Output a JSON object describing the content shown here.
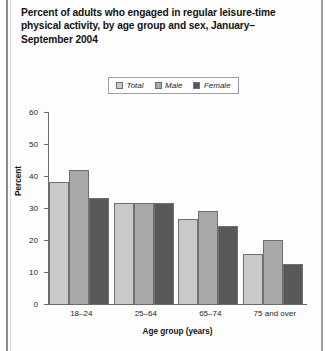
{
  "title": "Percent of adults who engaged in regular leisure-time physical activity, by age group and sex, January–September 2004",
  "colors": {
    "total": "#c9c9c9",
    "male": "#a8a8a8",
    "female": "#585858",
    "axis": "#6a6a6a",
    "text": "#1d1d1d"
  },
  "chart_data": {
    "type": "bar",
    "title": "Percent of adults who engaged in regular leisure-time physical activity, by age group and sex, January–September 2004",
    "xlabel": "Age group (years)",
    "ylabel": "Percent",
    "categories": [
      "18–24",
      "25–64",
      "65–74",
      "75 and over"
    ],
    "series": [
      {
        "name": "Total",
        "values": [
          38.0,
          31.5,
          26.5,
          15.5
        ]
      },
      {
        "name": "Male",
        "values": [
          42.0,
          31.5,
          29.0,
          20.0
        ]
      },
      {
        "name": "Female",
        "values": [
          33.0,
          31.5,
          24.5,
          12.5
        ]
      }
    ],
    "ylim": [
      0,
      60
    ],
    "yticks": [
      "0",
      "10",
      "20",
      "30",
      "40",
      "50",
      "60"
    ],
    "grid": false,
    "legend": {
      "position": "top-center",
      "entries": [
        "Total",
        "Male",
        "Female"
      ]
    }
  }
}
